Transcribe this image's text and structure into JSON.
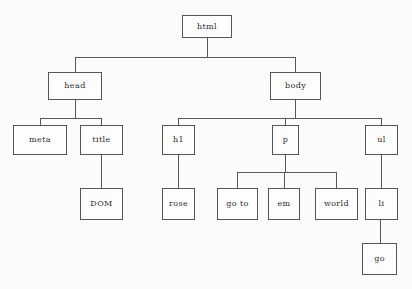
{
  "diagram": {
    "background_color": "#fbfbfb",
    "box_border_color": "#555555",
    "edge_color": "#585858",
    "text_color": "#2b2b2b",
    "nodes": [
      {
        "id": "html",
        "label": "html",
        "x": 182,
        "y": 15,
        "w": 50,
        "h": 23
      },
      {
        "id": "head",
        "label": "head",
        "x": 48,
        "y": 72,
        "w": 54,
        "h": 28
      },
      {
        "id": "body",
        "label": "body",
        "x": 270,
        "y": 72,
        "w": 51,
        "h": 28
      },
      {
        "id": "meta",
        "label": "meta",
        "x": 13,
        "y": 125,
        "w": 54,
        "h": 30
      },
      {
        "id": "title",
        "label": "title",
        "x": 80,
        "y": 125,
        "w": 43,
        "h": 30
      },
      {
        "id": "h1",
        "label": "h1",
        "x": 162,
        "y": 125,
        "w": 33,
        "h": 30
      },
      {
        "id": "p",
        "label": "p",
        "x": 272,
        "y": 125,
        "w": 27,
        "h": 30
      },
      {
        "id": "ul",
        "label": "ul",
        "x": 365,
        "y": 125,
        "w": 33,
        "h": 30
      },
      {
        "id": "dom",
        "label": "DOM",
        "x": 80,
        "y": 188,
        "w": 43,
        "h": 32
      },
      {
        "id": "rose",
        "label": "rose",
        "x": 162,
        "y": 188,
        "w": 33,
        "h": 32
      },
      {
        "id": "goto",
        "label": "go to",
        "x": 217,
        "y": 188,
        "w": 41,
        "h": 32
      },
      {
        "id": "em",
        "label": "em",
        "x": 268,
        "y": 188,
        "w": 32,
        "h": 32
      },
      {
        "id": "world",
        "label": "world",
        "x": 315,
        "y": 188,
        "w": 43,
        "h": 32
      },
      {
        "id": "li",
        "label": "li",
        "x": 365,
        "y": 188,
        "w": 33,
        "h": 32
      },
      {
        "id": "go",
        "label": "go",
        "x": 362,
        "y": 243,
        "w": 35,
        "h": 32
      }
    ],
    "edges": [
      {
        "id": "html-stem",
        "type": "v",
        "x": 207,
        "y": 38,
        "len": 19
      },
      {
        "id": "html-children-bar",
        "type": "h",
        "x": 75,
        "y": 57,
        "len": 221
      },
      {
        "id": "head-drop",
        "type": "v",
        "x": 75,
        "y": 57,
        "len": 15
      },
      {
        "id": "body-drop",
        "type": "v",
        "x": 295,
        "y": 57,
        "len": 15
      },
      {
        "id": "head-stem",
        "type": "v",
        "x": 75,
        "y": 100,
        "len": 18
      },
      {
        "id": "head-children-bar",
        "type": "h",
        "x": 40,
        "y": 118,
        "len": 62
      },
      {
        "id": "meta-drop",
        "type": "v",
        "x": 40,
        "y": 118,
        "len": 7
      },
      {
        "id": "title-drop",
        "type": "v",
        "x": 101,
        "y": 118,
        "len": 7
      },
      {
        "id": "body-stem",
        "type": "v",
        "x": 295,
        "y": 100,
        "len": 18
      },
      {
        "id": "body-children-bar",
        "type": "h",
        "x": 178,
        "y": 118,
        "len": 204
      },
      {
        "id": "h1-drop",
        "type": "v",
        "x": 178,
        "y": 118,
        "len": 7
      },
      {
        "id": "p-drop",
        "type": "v",
        "x": 285,
        "y": 118,
        "len": 7
      },
      {
        "id": "ul-drop",
        "type": "v",
        "x": 381,
        "y": 118,
        "len": 7
      },
      {
        "id": "title-dom-link",
        "type": "v",
        "x": 101,
        "y": 155,
        "len": 33
      },
      {
        "id": "h1-rose-link",
        "type": "v",
        "x": 178,
        "y": 155,
        "len": 33
      },
      {
        "id": "p-stem",
        "type": "v",
        "x": 285,
        "y": 155,
        "len": 17
      },
      {
        "id": "p-children-bar",
        "type": "h",
        "x": 237,
        "y": 172,
        "len": 100
      },
      {
        "id": "goto-drop",
        "type": "v",
        "x": 237,
        "y": 172,
        "len": 16
      },
      {
        "id": "em-drop",
        "type": "v",
        "x": 284,
        "y": 172,
        "len": 16
      },
      {
        "id": "world-drop",
        "type": "v",
        "x": 336,
        "y": 172,
        "len": 16
      },
      {
        "id": "ul-li-link",
        "type": "v",
        "x": 381,
        "y": 155,
        "len": 33
      },
      {
        "id": "li-go-link",
        "type": "v",
        "x": 380,
        "y": 220,
        "len": 23
      }
    ]
  }
}
